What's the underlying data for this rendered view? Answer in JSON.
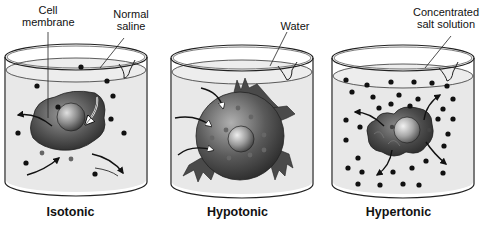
{
  "diagram": {
    "topic": "Effect of solution tonicity on a cell",
    "panels": [
      {
        "id": "isotonic",
        "title": "Isotonic",
        "labels": [
          "Cell membrane",
          "Normal saline"
        ],
        "label_lines": [
          [
            "Cell",
            "membrane"
          ],
          [
            "Normal",
            "saline"
          ]
        ],
        "cell_state": "normal",
        "solute_density": "equal"
      },
      {
        "id": "hypotonic",
        "title": "Hypotonic",
        "labels": [
          "Water"
        ],
        "label_lines": [
          [
            "Water"
          ]
        ],
        "cell_state": "swollen/bursting",
        "solute_density": "none"
      },
      {
        "id": "hypertonic",
        "title": "Hypertonic",
        "labels": [
          "Concentrated salt solution"
        ],
        "label_lines": [
          [
            "Concentrated",
            "salt solution"
          ]
        ],
        "cell_state": "shrunken",
        "solute_density": "high"
      }
    ]
  },
  "colors": {
    "liquid": "#e6e6e6",
    "beaker_outline": "#222222",
    "cell_dark": "#3a3a3a",
    "cell_light": "#bdbdbd",
    "solute": "#111111",
    "text": "#111111"
  }
}
